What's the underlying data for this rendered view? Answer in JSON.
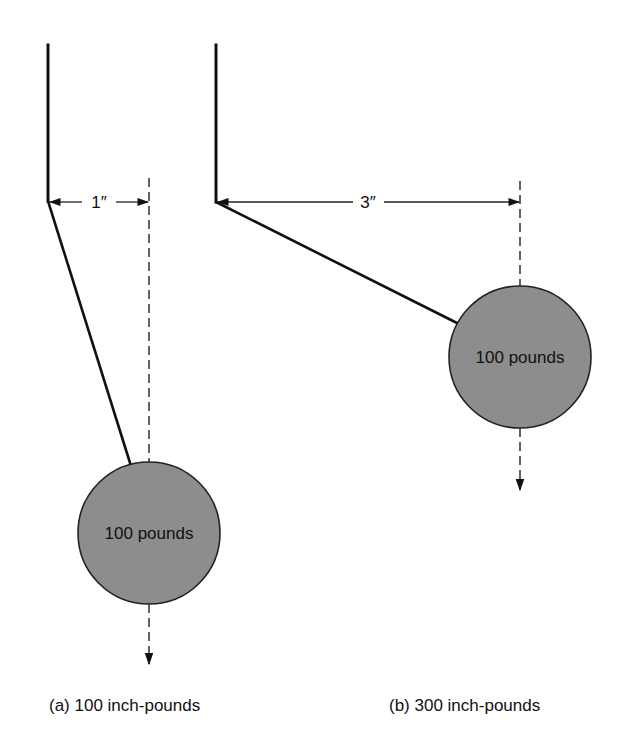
{
  "diagram": {
    "panels": [
      {
        "id": "a",
        "caption": "(a) 100 inch-pounds",
        "weight_label": "100 pounds",
        "distance_label": "1″",
        "distance_inches": 1,
        "weight_pounds": 100,
        "moment_inch_pounds": 100
      },
      {
        "id": "b",
        "caption": "(b) 300 inch-pounds",
        "weight_label": "100 pounds",
        "distance_label": "3″",
        "distance_inches": 3,
        "weight_pounds": 100,
        "moment_inch_pounds": 300
      }
    ],
    "colors": {
      "line": "#111111",
      "weight_fill": "#8d8d8d",
      "background": "#ffffff"
    }
  }
}
